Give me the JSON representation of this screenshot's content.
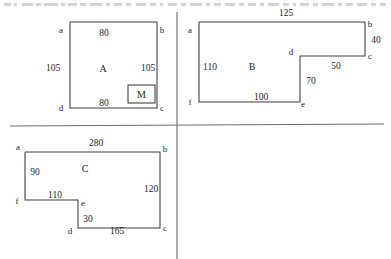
{
  "figures": [
    {
      "id": "A",
      "region_label": "A",
      "shape": "square",
      "outline_points": "70,22 157,22 157,108 70,108 70,22",
      "region_label_pos": {
        "x": 103,
        "y": 72
      },
      "marker": {
        "label": "M",
        "box": {
          "x": 128,
          "y": 85,
          "w": 27,
          "h": 18
        },
        "label_pos": {
          "x": 141.5,
          "y": 97.5
        }
      },
      "vertices": [
        {
          "name": "a",
          "x": 61,
          "y": 33
        },
        {
          "name": "b",
          "x": 162,
          "y": 33
        },
        {
          "name": "c",
          "x": 162,
          "y": 111
        },
        {
          "name": "d",
          "x": 61,
          "y": 111
        }
      ],
      "dimensions": [
        {
          "value": "80",
          "x": 104,
          "y": 36
        },
        {
          "value": "105",
          "x": 53,
          "y": 71
        },
        {
          "value": "105",
          "x": 148,
          "y": 71
        },
        {
          "value": "80",
          "x": 104,
          "y": 106
        }
      ]
    },
    {
      "id": "B",
      "region_label": "B",
      "shape": "notched-rectangle",
      "outline_points": "199,22 365,22 365,56 300,56 300,102 199,102 199,22",
      "region_label_pos": {
        "x": 252,
        "y": 70
      },
      "vertices": [
        {
          "name": "a",
          "x": 190,
          "y": 33
        },
        {
          "name": "b",
          "x": 370,
          "y": 27
        },
        {
          "name": "c",
          "x": 370,
          "y": 59
        },
        {
          "name": "d",
          "x": 291,
          "y": 55
        },
        {
          "name": "e",
          "x": 303,
          "y": 107
        },
        {
          "name": "f",
          "x": 190,
          "y": 105
        }
      ],
      "dimensions": [
        {
          "value": "125",
          "x": 286,
          "y": 16
        },
        {
          "value": "40",
          "x": 376,
          "y": 43
        },
        {
          "value": "50",
          "x": 336,
          "y": 69
        },
        {
          "value": "70",
          "x": 311,
          "y": 84
        },
        {
          "value": "110",
          "x": 210,
          "y": 70
        },
        {
          "value": "100",
          "x": 261,
          "y": 100
        }
      ]
    },
    {
      "id": "C",
      "region_label": "C",
      "shape": "notched-rectangle",
      "outline_points": "25,152 160,152 160,228 78,228 78,200 25,200 25,152",
      "region_label_pos": {
        "x": 85,
        "y": 172
      },
      "vertices": [
        {
          "name": "a",
          "x": 18,
          "y": 150
        },
        {
          "name": "b",
          "x": 165,
          "y": 152
        },
        {
          "name": "c",
          "x": 165,
          "y": 231
        },
        {
          "name": "d",
          "x": 70,
          "y": 234
        },
        {
          "name": "e",
          "x": 83,
          "y": 206
        },
        {
          "name": "f",
          "x": 17,
          "y": 204
        }
      ],
      "dimensions": [
        {
          "value": "280",
          "x": 96,
          "y": 146
        },
        {
          "value": "90",
          "x": 35,
          "y": 175
        },
        {
          "value": "120",
          "x": 151,
          "y": 192
        },
        {
          "value": "110",
          "x": 55,
          "y": 198
        },
        {
          "value": "30",
          "x": 88,
          "y": 222
        },
        {
          "value": "165",
          "x": 117,
          "y": 234
        }
      ]
    }
  ],
  "dividers": [
    {
      "name": "horizontal-divider",
      "x1": 10,
      "y1": 126,
      "x2": 384,
      "y2": 124
    },
    {
      "name": "vertical-divider",
      "x1": 177,
      "y1": 12,
      "x2": 177,
      "y2": 259
    }
  ],
  "scan_artifacts": [
    {
      "x": 4,
      "w": 7
    },
    {
      "x": 14,
      "w": 3
    },
    {
      "x": 22,
      "w": 11
    },
    {
      "x": 36,
      "w": 5
    },
    {
      "x": 44,
      "w": 14
    },
    {
      "x": 61,
      "w": 4
    },
    {
      "x": 68,
      "w": 9
    },
    {
      "x": 80,
      "w": 6
    },
    {
      "x": 90,
      "w": 12
    },
    {
      "x": 106,
      "w": 4
    },
    {
      "x": 114,
      "w": 8
    },
    {
      "x": 126,
      "w": 5
    },
    {
      "x": 136,
      "w": 10
    },
    {
      "x": 150,
      "w": 6
    },
    {
      "x": 160,
      "w": 3
    },
    {
      "x": 168,
      "w": 9
    },
    {
      "x": 181,
      "w": 5
    },
    {
      "x": 190,
      "w": 12
    },
    {
      "x": 206,
      "w": 4
    },
    {
      "x": 214,
      "w": 7
    },
    {
      "x": 225,
      "w": 10
    },
    {
      "x": 239,
      "w": 5
    },
    {
      "x": 248,
      "w": 8
    },
    {
      "x": 260,
      "w": 4
    },
    {
      "x": 268,
      "w": 11
    },
    {
      "x": 283,
      "w": 6
    },
    {
      "x": 293,
      "w": 3
    },
    {
      "x": 300,
      "w": 9
    },
    {
      "x": 313,
      "w": 5
    },
    {
      "x": 322,
      "w": 12
    },
    {
      "x": 338,
      "w": 4
    },
    {
      "x": 346,
      "w": 7
    },
    {
      "x": 357,
      "w": 10
    },
    {
      "x": 371,
      "w": 5
    },
    {
      "x": 380,
      "w": 6
    }
  ]
}
